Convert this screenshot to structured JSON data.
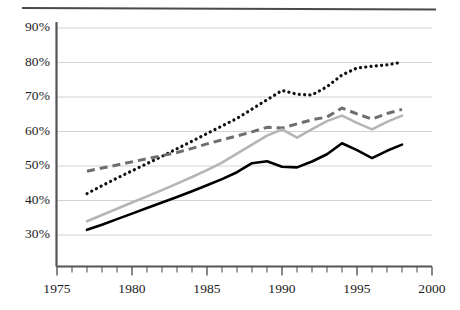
{
  "chart_data": {
    "type": "line",
    "title": "",
    "subtitle": "",
    "xlabel": "",
    "ylabel": "",
    "xlim": [
      1975,
      2000
    ],
    "ylim": [
      25,
      93
    ],
    "grid": true,
    "grid_axis": "y",
    "legend": "none",
    "x": [
      1977,
      1978,
      1979,
      1980,
      1981,
      1982,
      1983,
      1984,
      1985,
      1986,
      1987,
      1988,
      1989,
      1990,
      1991,
      1992,
      1993,
      1994,
      1995,
      1996,
      1997,
      1998
    ],
    "y_ticks": [
      30,
      40,
      50,
      60,
      70,
      80,
      90
    ],
    "y_tick_labels": [
      "30%",
      "40%",
      "50%",
      "60%",
      "70%",
      "80%",
      "90%"
    ],
    "x_ticks": [
      1975,
      1980,
      1985,
      1990,
      1995,
      2000
    ],
    "x_tick_labels": [
      "1975",
      "1980",
      "1985",
      "1990",
      "1995",
      "2000"
    ],
    "x_minor_ticks": [
      1976,
      1977,
      1978,
      1979,
      1981,
      1982,
      1983,
      1984,
      1986,
      1987,
      1988,
      1989,
      1991,
      1992,
      1993,
      1994,
      1996,
      1997,
      1998,
      1999
    ],
    "series": [
      {
        "name": "dotted-series",
        "style": "dotted",
        "color": "#111111",
        "values": [
          42.0,
          44.3,
          46.5,
          48.6,
          50.7,
          52.8,
          55.0,
          57.2,
          59.4,
          61.6,
          63.8,
          66.5,
          69.2,
          71.9,
          70.8,
          70.6,
          73.0,
          76.4,
          78.4,
          78.9,
          79.3,
          80.1
        ]
      },
      {
        "name": "dashed-series",
        "style": "dashed",
        "color": "#6e6e6e",
        "values": [
          48.5,
          49.4,
          50.3,
          51.2,
          52.1,
          53.0,
          53.9,
          55.1,
          56.4,
          57.6,
          58.7,
          59.9,
          61.2,
          61.0,
          62.2,
          63.4,
          64.2,
          66.8,
          65.1,
          63.6,
          65.2,
          66.4
        ]
      },
      {
        "name": "gray-solid-series",
        "style": "solid",
        "color": "#b5b5b5",
        "values": [
          34.0,
          35.8,
          37.6,
          39.4,
          41.2,
          43.0,
          44.9,
          46.8,
          48.8,
          51.0,
          53.6,
          56.2,
          58.8,
          60.6,
          58.2,
          60.7,
          63.0,
          64.6,
          62.5,
          60.6,
          62.8,
          64.6
        ]
      },
      {
        "name": "black-solid-series",
        "style": "solid",
        "color": "#000000",
        "values": [
          31.5,
          33.0,
          34.6,
          36.2,
          37.8,
          39.4,
          41.0,
          42.7,
          44.4,
          46.2,
          48.2,
          50.8,
          51.4,
          49.8,
          49.6,
          51.3,
          53.4,
          56.6,
          54.6,
          52.3,
          54.4,
          56.2
        ]
      }
    ]
  },
  "axes": {
    "axis_color": "#555555",
    "gridline_color": "#d2d2d2"
  }
}
